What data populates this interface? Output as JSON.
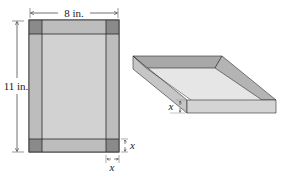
{
  "sheet": {
    "width_label": "8 in.",
    "height_label": "11 in.",
    "cut_label_right": "x",
    "cut_label_bottom": "x"
  },
  "tray": {
    "height_label": "x"
  },
  "colors": {
    "corner_square": "#8a8a8a",
    "flap": "#bdbdbd",
    "base": "#d2d2d2",
    "outline": "#2a2a2a",
    "tray_top_inside": "#e6e6e6",
    "tray_side_light": "#d0d0d0",
    "tray_side_dark": "#a8a8a8"
  }
}
